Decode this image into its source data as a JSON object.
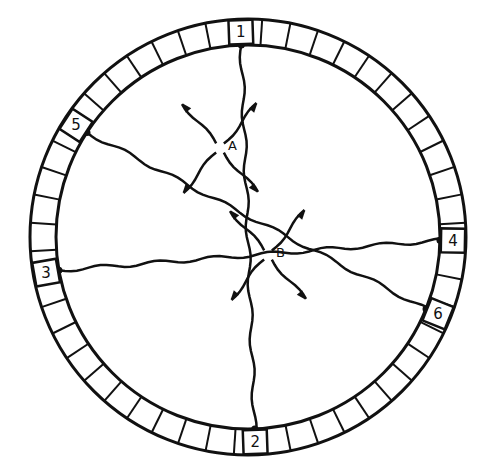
{
  "diagram": {
    "segments": 48,
    "detectors": [
      {
        "label": "1",
        "angle": -92
      },
      {
        "label": "2",
        "angle": 88
      },
      {
        "label": "3",
        "angle": 170
      },
      {
        "label": "4",
        "angle": 1
      },
      {
        "label": "5",
        "angle": -147
      },
      {
        "label": "6",
        "angle": 22
      }
    ],
    "sources": [
      {
        "label": "A",
        "x": 220,
        "y": 148
      },
      {
        "label": "B",
        "x": 268,
        "y": 255
      }
    ],
    "lines": [
      {
        "from": "1",
        "to": "2"
      },
      {
        "from": "5",
        "to": "6"
      },
      {
        "from": "3",
        "to": "4"
      }
    ]
  }
}
